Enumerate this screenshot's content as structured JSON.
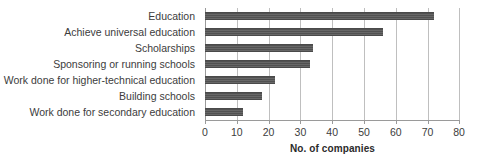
{
  "chart_data": {
    "type": "bar",
    "orientation": "horizontal",
    "title": "",
    "subtitle": "",
    "xlabel": "No. of companies",
    "ylabel": "",
    "xlim": [
      0,
      80
    ],
    "xticks": [
      0,
      10,
      20,
      30,
      40,
      50,
      60,
      70,
      80
    ],
    "xtick_labels": [
      "0",
      "10",
      "20",
      "30",
      "40",
      "50",
      "60",
      "70",
      "80"
    ],
    "grid": true,
    "grid_axis": "x",
    "legend": false,
    "legend_position": "none",
    "bar_color": "#565656",
    "gridline_color": "#bfbfbf",
    "axis_color": "#9a9a9a",
    "text_color": "#3c3c3c",
    "background": "#ffffff",
    "categories": [
      "Education",
      "Achieve universal education",
      "Scholarships",
      "Sponsoring or running schools",
      "Work done for higher-technical education",
      "Building schools",
      "Work done for secondary education"
    ],
    "values": [
      72,
      56,
      34,
      33,
      22,
      18,
      12
    ],
    "bars": [
      {
        "label": "Education",
        "value": 72
      },
      {
        "label": "Achieve universal education",
        "value": 56
      },
      {
        "label": "Scholarships",
        "value": 34
      },
      {
        "label": "Sponsoring or running schools",
        "value": 33
      },
      {
        "label": "Work done for higher-technical education",
        "value": 22
      },
      {
        "label": "Building schools",
        "value": 18
      },
      {
        "label": "Work done for secondary education",
        "value": 12
      }
    ]
  }
}
